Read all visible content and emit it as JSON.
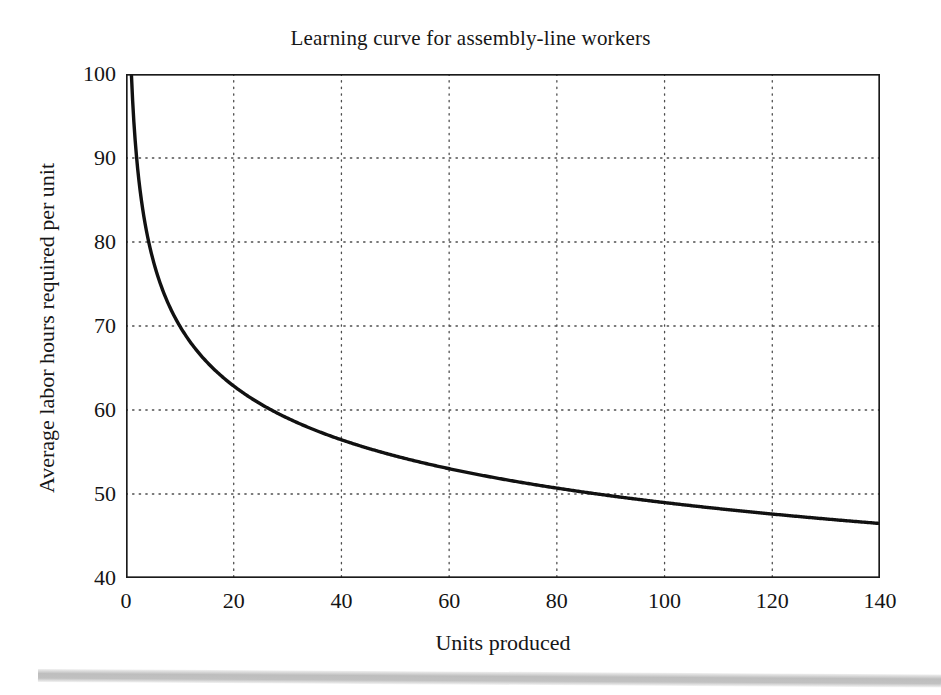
{
  "chart_data": {
    "type": "line",
    "title": "Learning curve for assembly-line workers",
    "xlabel": "Units produced",
    "ylabel": "Average labor hours required per unit",
    "xlim": [
      0,
      140
    ],
    "ylim": [
      40,
      100
    ],
    "xticks": [
      0,
      20,
      40,
      60,
      80,
      100,
      120,
      140
    ],
    "yticks": [
      40,
      50,
      60,
      70,
      80,
      90,
      100
    ],
    "grid": true,
    "grid_style": "dotted",
    "legend": null,
    "series": [
      {
        "name": "Average labor hours per unit",
        "model": "y = 100 * x^(-0.155)",
        "x": [
          1,
          2,
          3,
          4,
          5,
          6,
          8,
          10,
          12,
          15,
          20,
          25,
          30,
          35,
          40,
          50,
          60,
          70,
          80,
          90,
          100,
          110,
          120,
          130,
          140
        ],
        "y": [
          100.0,
          89.8,
          84.4,
          80.7,
          77.9,
          75.8,
          72.5,
          70.0,
          68.1,
          65.8,
          62.9,
          60.7,
          59.0,
          57.6,
          56.4,
          54.6,
          53.1,
          52.0,
          51.0,
          50.2,
          49.5,
          48.8,
          48.2,
          47.7,
          47.2
        ],
        "color": "#111111",
        "linewidth": 3.4,
        "marker": "none"
      }
    ]
  },
  "axis_colors": {
    "frame": "#1a1a1a",
    "grid": "#4d4d4d",
    "text": "#161616",
    "background": "#ffffff"
  },
  "artifact": {
    "scan_band_label": "scan-shadow-band"
  }
}
